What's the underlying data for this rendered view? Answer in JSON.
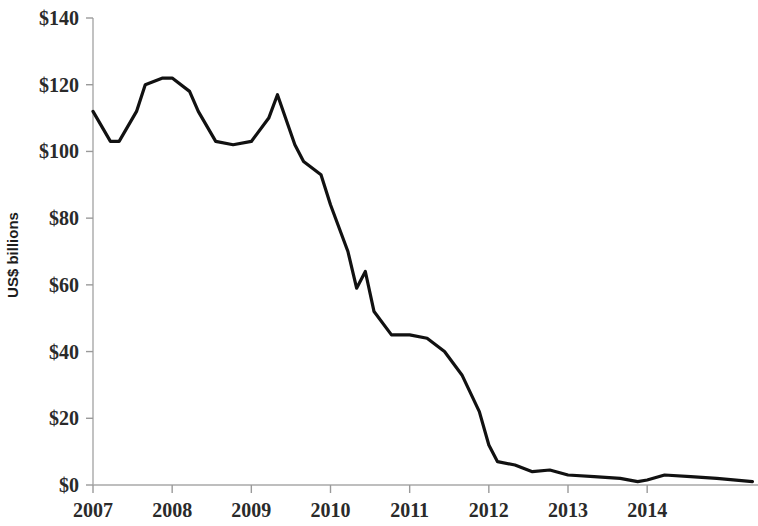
{
  "chart_data": {
    "type": "line",
    "title": "",
    "subtitle": "",
    "xlabel": "",
    "ylabel": "US$ billions",
    "ylim": [
      0,
      140
    ],
    "xlim": [
      2007.0,
      2015.4
    ],
    "grid": false,
    "legend": null,
    "y_ticks": [
      0,
      20,
      40,
      60,
      80,
      100,
      120,
      140
    ],
    "y_tick_labels": [
      "$0",
      "$20",
      "$40",
      "$60",
      "$80",
      "$100",
      "$120",
      "$140"
    ],
    "x_ticks": [
      2007,
      2008,
      2009,
      2010,
      2011,
      2012,
      2013,
      2014
    ],
    "x_tick_labels": [
      "2007",
      "2008",
      "2009",
      "2010",
      "2011",
      "2012",
      "2013",
      "2014"
    ],
    "line_color": "#111111",
    "axis_color": "#a8a8a8",
    "series": [
      {
        "name": "US$ billions",
        "x": [
          2007.0,
          2007.22,
          2007.33,
          2007.55,
          2007.66,
          2007.88,
          2008.0,
          2008.22,
          2008.33,
          2008.55,
          2008.77,
          2009.0,
          2009.22,
          2009.33,
          2009.55,
          2009.66,
          2009.88,
          2010.0,
          2010.22,
          2010.33,
          2010.44,
          2010.55,
          2010.77,
          2011.0,
          2011.22,
          2011.44,
          2011.66,
          2011.88,
          2012.0,
          2012.11,
          2012.33,
          2012.55,
          2012.77,
          2013.0,
          2013.33,
          2013.66,
          2013.88,
          2014.0,
          2014.22,
          2014.55,
          2014.88,
          2015.33
        ],
        "values": [
          112,
          103,
          103,
          112,
          120,
          122,
          122,
          118,
          112,
          103,
          102,
          103,
          110,
          117,
          102,
          97,
          93,
          84,
          70,
          59,
          64,
          52,
          45,
          45,
          44,
          40,
          33,
          22,
          12,
          7,
          6,
          4,
          4.5,
          3,
          2.5,
          2,
          1,
          1.5,
          3,
          2.5,
          2,
          1
        ]
      }
    ]
  },
  "axis": {
    "y_label_text": "US$ billions"
  }
}
